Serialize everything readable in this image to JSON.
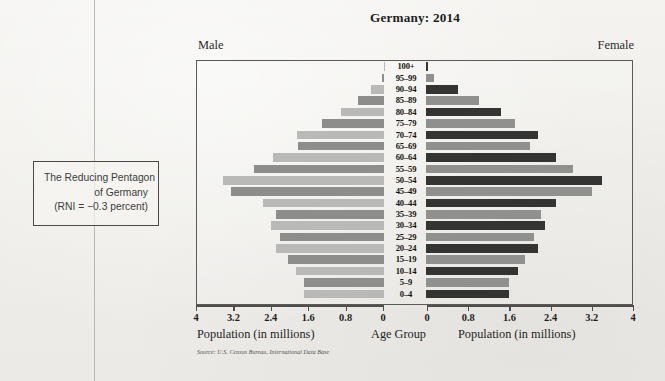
{
  "callout": {
    "line1": "The Reducing Pentagon",
    "line2": "of Germany",
    "line3": "(RNI = −0.3 percent)"
  },
  "chart": {
    "title": "Germany: 2014",
    "male_label": "Male",
    "female_label": "Female",
    "left_caption": "Population (in millions)",
    "center_caption": "Age Group",
    "right_caption": "Population (in millions)",
    "source": "Source: U.S. Census Bureau, International Data Base"
  },
  "chart_data": {
    "type": "bar",
    "subtype": "population-pyramid",
    "title": "Germany: 2014",
    "xlabel": "Population (in millions)",
    "ylabel": "Age Group",
    "xlim": [
      0,
      4
    ],
    "xticks": [
      "4",
      "3.2",
      "2.4",
      "1.6",
      "0.8",
      "0"
    ],
    "xticks_right": [
      "0",
      "0.8",
      "1.6",
      "2.4",
      "3.2",
      "4"
    ],
    "grid": false,
    "legend": false,
    "categories": [
      "100+",
      "95–99",
      "90–94",
      "85–89",
      "80–84",
      "75–79",
      "70–74",
      "65–69",
      "60–64",
      "55–59",
      "50–54",
      "45–49",
      "40–44",
      "35–39",
      "30–34",
      "25–29",
      "20–24",
      "15–19",
      "10–14",
      "5–9",
      "0–4"
    ],
    "series": [
      {
        "name": "Male",
        "side": "left",
        "colors": [
          "#b9b9b7",
          "#8d8d8b"
        ],
        "values": [
          0.01,
          0.05,
          0.28,
          0.55,
          0.92,
          1.32,
          1.86,
          1.85,
          2.38,
          2.78,
          3.45,
          3.28,
          2.58,
          2.32,
          2.42,
          2.22,
          2.32,
          2.05,
          1.88,
          1.72,
          1.72
        ]
      },
      {
        "name": "Female",
        "side": "right",
        "colors": [
          "#343432",
          "#90908e"
        ],
        "values": [
          0.03,
          0.15,
          0.62,
          1.02,
          1.46,
          1.72,
          2.18,
          2.02,
          2.52,
          2.85,
          3.42,
          3.22,
          2.52,
          2.24,
          2.32,
          2.1,
          2.18,
          1.92,
          1.78,
          1.62,
          1.62
        ]
      }
    ]
  }
}
